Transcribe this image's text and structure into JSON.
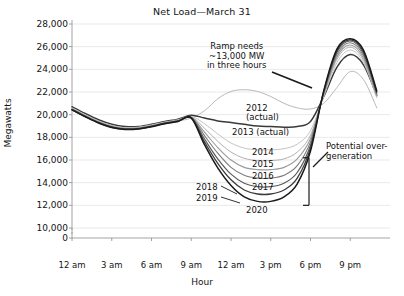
{
  "chart_data": {
    "type": "line",
    "title": "Net Load—March 31",
    "xlabel": "Hour",
    "ylabel": "Megawatts",
    "grid": true,
    "legend_position": "inline-labels",
    "ylim": [
      10000,
      28000
    ],
    "yticks": [
      0,
      10000,
      12000,
      14000,
      16000,
      18000,
      20000,
      22000,
      24000,
      26000,
      28000
    ],
    "ytick_labels": [
      "0",
      "10,000",
      "12,000",
      "14,000",
      "16,000",
      "18,000",
      "20,000",
      "22,000",
      "24,000",
      "26,000",
      "28,000"
    ],
    "axis_break_between": [
      0,
      10000
    ],
    "xlim": [
      0,
      24
    ],
    "xticks": [
      0,
      3,
      6,
      9,
      12,
      15,
      18,
      21
    ],
    "xtick_labels": [
      "12 am",
      "3 am",
      "6 am",
      "9 am",
      "12 am",
      "3 pm",
      "6 pm",
      "9 pm"
    ],
    "x": [
      0,
      1,
      2,
      3,
      4,
      5,
      6,
      7,
      8,
      9,
      10,
      11,
      12,
      13,
      14,
      15,
      16,
      17,
      18,
      19,
      20,
      21,
      22,
      23
    ],
    "series": [
      {
        "name": "2012 (actual)",
        "label": "2012\n(actual)",
        "color": "#b9b9b9",
        "width": 1.0,
        "values": [
          20400,
          19850,
          19300,
          18950,
          18750,
          18800,
          19000,
          19250,
          19450,
          19700,
          20350,
          21400,
          22050,
          22200,
          22050,
          21600,
          21000,
          20600,
          20500,
          21000,
          22400,
          23800,
          23100,
          20600
        ]
      },
      {
        "name": "2013 (actual)",
        "label": "2013 (actual)",
        "color": "#3a3a3a",
        "width": 1.5,
        "values": [
          20700,
          20100,
          19550,
          19150,
          18950,
          18950,
          19150,
          19400,
          19600,
          19950,
          19700,
          19450,
          19300,
          19150,
          19000,
          18950,
          18900,
          18950,
          19400,
          21600,
          24200,
          25300,
          24400,
          21700
        ]
      },
      {
        "name": "2014",
        "label": "2014",
        "color": "#c4c4c4",
        "width": 1.0,
        "values": [
          20600,
          20000,
          19450,
          19050,
          18850,
          18900,
          19100,
          19350,
          19550,
          19850,
          19200,
          18300,
          17500,
          17050,
          16900,
          16900,
          17000,
          17400,
          18600,
          21600,
          24600,
          25700,
          24600,
          21500
        ]
      },
      {
        "name": "2015",
        "label": "2015",
        "color": "#b0b0b0",
        "width": 1.0,
        "values": [
          20550,
          19950,
          19400,
          19000,
          18800,
          18850,
          19050,
          19300,
          19500,
          19800,
          18800,
          17650,
          16700,
          16150,
          15950,
          15950,
          16100,
          16700,
          18200,
          21700,
          24900,
          25950,
          24800,
          21600
        ]
      },
      {
        "name": "2016",
        "label": "2016",
        "color": "#9a9a9a",
        "width": 1.1,
        "values": [
          20500,
          19900,
          19350,
          18950,
          18780,
          18820,
          19020,
          19280,
          19480,
          19780,
          18450,
          17100,
          16000,
          15350,
          15150,
          15150,
          15350,
          16100,
          17900,
          21800,
          25100,
          26150,
          25000,
          21700
        ]
      },
      {
        "name": "2017",
        "label": "2017",
        "color": "#7c7c7c",
        "width": 1.1,
        "values": [
          20480,
          19880,
          19330,
          18930,
          18760,
          18800,
          19000,
          19260,
          19460,
          19760,
          18150,
          16600,
          15350,
          14650,
          14400,
          14400,
          14650,
          15500,
          17600,
          21900,
          25300,
          26350,
          25200,
          21800
        ]
      },
      {
        "name": "2018",
        "label": "2018",
        "color": "#5c5c5c",
        "width": 1.2,
        "values": [
          20460,
          19860,
          19310,
          18910,
          18740,
          18780,
          18980,
          19240,
          19440,
          19740,
          17850,
          16100,
          14750,
          13950,
          13650,
          13650,
          13950,
          14900,
          17300,
          22000,
          25500,
          26500,
          25400,
          21900
        ]
      },
      {
        "name": "2019",
        "label": "2019",
        "color": "#3c3c3c",
        "width": 1.3,
        "values": [
          20440,
          19840,
          19290,
          18890,
          18720,
          18760,
          18960,
          19220,
          19420,
          19720,
          17600,
          15700,
          14250,
          13350,
          13000,
          13000,
          13350,
          14400,
          17050,
          22050,
          25650,
          26600,
          25550,
          22000
        ]
      },
      {
        "name": "2020",
        "label": "2020",
        "color": "#1a1a1a",
        "width": 1.5,
        "values": [
          20420,
          19820,
          19270,
          18870,
          18700,
          18740,
          18940,
          19200,
          19400,
          19700,
          17350,
          15300,
          13750,
          12750,
          12350,
          12350,
          12750,
          13900,
          16800,
          22100,
          25800,
          26700,
          25700,
          22100
        ]
      }
    ],
    "annotations": [
      {
        "name": "ramp-needs",
        "text_lines": [
          "Ramp needs",
          "~13,000 MW",
          "in three hours"
        ],
        "has_leader_line": true
      },
      {
        "name": "potential-overgeneration",
        "text_lines": [
          "Potential over-",
          "generation"
        ],
        "has_leader_line": true,
        "has_bracket": true,
        "bracket_range": [
          12000,
          16200
        ]
      }
    ]
  }
}
